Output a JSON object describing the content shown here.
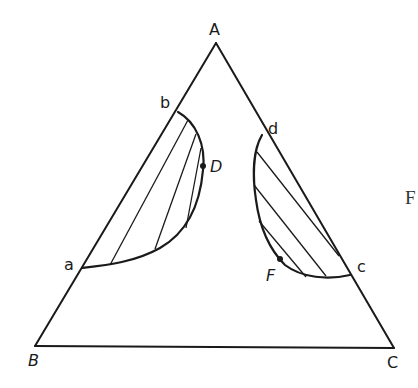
{
  "figure": {
    "type": "ternary-phase-diagram",
    "vertices": [
      {
        "id": "A",
        "label": "A",
        "x": 216,
        "y": 43
      },
      {
        "id": "B",
        "label": "B",
        "x": 35,
        "y": 346
      },
      {
        "id": "C",
        "label": "C",
        "x": 394,
        "y": 348
      }
    ],
    "boundary_points": [
      {
        "id": "a",
        "label": "a",
        "on_edge": "AB"
      },
      {
        "id": "b",
        "label": "b",
        "on_edge": "AB"
      },
      {
        "id": "c",
        "label": "c",
        "on_edge": "AC"
      },
      {
        "id": "d",
        "label": "d",
        "on_edge": "AC"
      }
    ],
    "marked_points": [
      {
        "id": "D",
        "label": "D",
        "region": "left-lobe"
      },
      {
        "id": "F",
        "label": "F",
        "region": "right-lobe"
      }
    ],
    "regions": [
      {
        "name": "left two-phase region",
        "bounded_by": [
          "a",
          "b"
        ],
        "tie_line_count": 3
      },
      {
        "name": "right two-phase region",
        "bounded_by": [
          "d",
          "c"
        ],
        "tie_line_count": 4
      }
    ],
    "cropped_text": "F"
  },
  "labels": {
    "A": "A",
    "B": "B",
    "C": "C",
    "a": "a",
    "b": "b",
    "c": "c",
    "d": "d",
    "D": "D",
    "F": "F",
    "edge_partial": "F"
  },
  "colors": {
    "ink": "#1a1a1a",
    "background": "#ffffff"
  }
}
